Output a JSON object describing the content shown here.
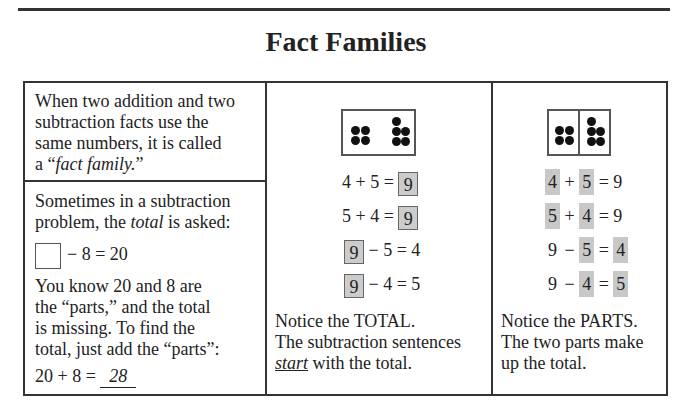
{
  "page": {
    "title": "Fact Families"
  },
  "left_column": {
    "definition": {
      "line1": "When two addition and two",
      "line2": "subtraction facts use the",
      "line3": "same numbers, it is called",
      "line4_prefix": "a “",
      "line4_term": "fact family.",
      "line4_suffix": "”"
    },
    "example": {
      "intro_line1": "Sometimes in a subtraction",
      "intro_line2_prefix": "problem, the ",
      "intro_line2_term": "total",
      "intro_line2_suffix": " is asked:",
      "equation_rest": "− 8 = 20",
      "explain_line1": "You know 20 and 8 are",
      "explain_line2": "the “parts,” and the total",
      "explain_line3": "is missing. To find the",
      "explain_line4": "total, just add the “parts”:",
      "answer_prefix": "20 + 8 = ",
      "answer_value": "28"
    }
  },
  "middle_column": {
    "domino": {
      "left_dots": 4,
      "right_dots": 5
    },
    "equations": [
      {
        "left": "4 + 5 = ",
        "boxed": "9",
        "right": ""
      },
      {
        "left": "5 + 4 = ",
        "boxed": "9",
        "right": ""
      },
      {
        "left": "",
        "boxed": "9",
        "right": " − 5 = 4"
      },
      {
        "left": "",
        "boxed": "9",
        "right": " − 4 = 5"
      }
    ],
    "note_line1": "Notice the TOTAL.",
    "note_line2": "The subtraction sentences",
    "note_line3_term": "start",
    "note_line3_suffix": " with the total."
  },
  "right_column": {
    "domino": {
      "left_dots": 4,
      "right_dots": 5,
      "divided": true
    },
    "equations": [
      {
        "a": "4",
        "op1": "+",
        "b": "5",
        "op2": "=",
        "c": "9"
      },
      {
        "a": "5",
        "op1": "+",
        "b": "4",
        "op2": "=",
        "c": "9"
      },
      {
        "a": "9",
        "op1": "−",
        "b": "5",
        "op2": "=",
        "c": "4"
      },
      {
        "a": "9",
        "op1": "−",
        "b": "4",
        "op2": "=",
        "c": "5"
      }
    ],
    "note_line1": "Notice the PARTS.",
    "note_line2": "The two parts make",
    "note_line3": "up the total."
  },
  "colors": {
    "highlight": "#c8c8c8",
    "border": "#333333"
  }
}
